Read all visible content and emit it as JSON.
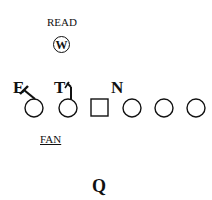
{
  "diagram": {
    "read_label": "READ",
    "linebacker": "W",
    "defenders": [
      {
        "label": "E"
      },
      {
        "label": "T"
      },
      {
        "label": "N"
      }
    ],
    "fan_label": "FAN",
    "quarterback": "Q",
    "offensive_line": [
      {
        "shape": "circle"
      },
      {
        "shape": "circle"
      },
      {
        "shape": "square"
      },
      {
        "shape": "circle"
      },
      {
        "shape": "circle"
      },
      {
        "shape": "circle"
      }
    ]
  }
}
